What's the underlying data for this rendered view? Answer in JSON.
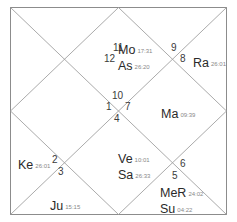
{
  "chart": {
    "style": "north-indian",
    "line_color": "#9a9a9a",
    "border_color": "#8c8c8c",
    "house_numbers": [
      {
        "id": "h11",
        "label": "11",
        "x": 113,
        "y": 43
      },
      {
        "id": "h12",
        "label": "12",
        "x": 104,
        "y": 54
      },
      {
        "id": "h9",
        "label": "9",
        "x": 171,
        "y": 43
      },
      {
        "id": "h8",
        "label": "8",
        "x": 180,
        "y": 54
      },
      {
        "id": "h10",
        "label": "10",
        "x": 113,
        "y": 91
      },
      {
        "id": "h1",
        "label": "1",
        "x": 106,
        "y": 102
      },
      {
        "id": "h7",
        "label": "7",
        "x": 125,
        "y": 102
      },
      {
        "id": "h4",
        "label": "4",
        "x": 114,
        "y": 114
      },
      {
        "id": "h2",
        "label": "2",
        "x": 52,
        "y": 155
      },
      {
        "id": "h3",
        "label": "3",
        "x": 58,
        "y": 167
      },
      {
        "id": "h6",
        "label": "6",
        "x": 180,
        "y": 159
      },
      {
        "id": "h5",
        "label": "5",
        "x": 172,
        "y": 171
      }
    ],
    "planets": [
      {
        "id": "mo",
        "name": "Mo",
        "degree": "17:31",
        "x": 118,
        "y": 41
      },
      {
        "id": "as",
        "name": "As",
        "degree": "26:20",
        "x": 118,
        "y": 57
      },
      {
        "id": "ra",
        "name": "Ra",
        "degree": "26:01",
        "x": 193,
        "y": 54
      },
      {
        "id": "ma",
        "name": "Ma",
        "degree": "09:39",
        "x": 161,
        "y": 105
      },
      {
        "id": "ke",
        "name": "Ke",
        "degree": "26:01",
        "x": 18,
        "y": 156
      },
      {
        "id": "ve",
        "name": "Ve",
        "degree": "10:01",
        "x": 118,
        "y": 150
      },
      {
        "id": "sa",
        "name": "Sa",
        "degree": "26:33",
        "x": 118,
        "y": 166
      },
      {
        "id": "mer",
        "name": "MeR",
        "degree": "24:02",
        "x": 160,
        "y": 184
      },
      {
        "id": "su",
        "name": "Su",
        "degree": "04:22",
        "x": 160,
        "y": 200
      },
      {
        "id": "ju",
        "name": "Ju",
        "degree": "15:15",
        "x": 50,
        "y": 197
      }
    ]
  }
}
